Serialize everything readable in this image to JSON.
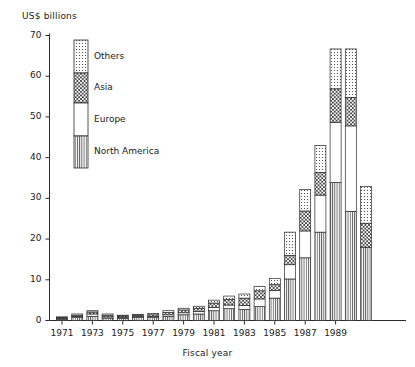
{
  "chart_data": {
    "type": "bar",
    "subtype": "stacked-bar",
    "title": "",
    "xlabel": "Fiscal year",
    "ylabel": "US$ billions",
    "yunit": "US$ billions",
    "ylim": [
      0,
      70
    ],
    "yticks": [
      0,
      10,
      20,
      30,
      40,
      50,
      60,
      70
    ],
    "grid": false,
    "legend_position": "inside-upper-left",
    "categories": [
      "1971",
      "1972",
      "1973",
      "1974",
      "1975",
      "1976",
      "1977",
      "1978",
      "1979",
      "1980",
      "1981",
      "1982",
      "1983",
      "1984",
      "1985",
      "1986",
      "1987",
      "1988",
      "1989",
      "1990",
      "1991"
    ],
    "xtick_labels": [
      "1971",
      "1973",
      "1975",
      "1977",
      "1979",
      "1981",
      "1983",
      "1985",
      "1987",
      "1989"
    ],
    "series": [
      {
        "name": "North America",
        "pattern": "vertical-lines",
        "values": [
          0.3,
          0.7,
          1.0,
          0.6,
          0.5,
          0.7,
          0.7,
          1.0,
          1.4,
          1.6,
          2.4,
          2.9,
          2.7,
          3.4,
          5.5,
          10.2,
          15.4,
          21.7,
          33.9,
          26.8,
          18.0
        ]
      },
      {
        "name": "Europe",
        "pattern": "blank",
        "values": [
          0.2,
          0.3,
          0.6,
          0.3,
          0.3,
          0.3,
          0.3,
          0.4,
          0.5,
          0.6,
          0.8,
          0.9,
          1.0,
          1.9,
          1.9,
          3.5,
          6.6,
          9.1,
          14.8,
          21.0,
          0.0
        ]
      },
      {
        "name": "Asia",
        "pattern": "cross-hatch",
        "values": [
          0.2,
          0.3,
          0.5,
          0.4,
          0.3,
          0.3,
          0.4,
          0.6,
          0.7,
          0.8,
          1.1,
          1.4,
          1.8,
          2.0,
          1.4,
          2.3,
          4.9,
          5.6,
          8.2,
          7.0,
          5.9
        ]
      },
      {
        "name": "Others",
        "pattern": "dots",
        "values": [
          0.2,
          0.3,
          0.3,
          0.3,
          0.2,
          0.2,
          0.3,
          0.4,
          0.4,
          0.5,
          0.7,
          0.8,
          1.0,
          1.1,
          1.5,
          5.7,
          5.3,
          6.6,
          9.8,
          11.9,
          9.0
        ]
      }
    ],
    "totals": [
      0.9,
      1.6,
      2.4,
      1.6,
      1.3,
      1.5,
      1.7,
      2.4,
      3.0,
      3.5,
      5.0,
      6.0,
      6.5,
      8.4,
      10.3,
      21.7,
      32.2,
      43.0,
      66.7,
      66.7,
      56.3
    ]
  },
  "legend": {
    "items": [
      {
        "label": "Others"
      },
      {
        "label": "Asia"
      },
      {
        "label": "Europe"
      },
      {
        "label": "North America"
      }
    ]
  },
  "colors": {
    "ink": "#1a1a1a",
    "axis": "#2a2a2a",
    "fill": "#ffffff",
    "pattern": "#333333"
  }
}
